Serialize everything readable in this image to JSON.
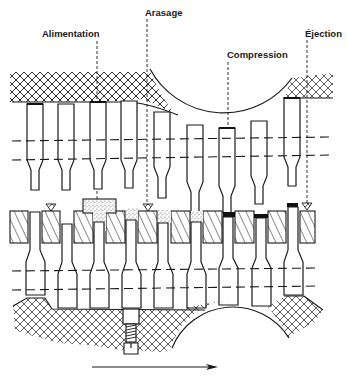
{
  "figure": {
    "type": "rotary tablet press compression cycle schematic",
    "labels": [
      {
        "id": "alimentation",
        "text": "Alimentation",
        "x": 42,
        "y": 37,
        "leader_x": 97
      },
      {
        "id": "arasage",
        "text": "Arasage",
        "x": 145,
        "y": 16,
        "leader_x": 147
      },
      {
        "id": "compression",
        "text": "Compression",
        "x": 227,
        "y": 58,
        "leader_x": 228
      },
      {
        "id": "ejection",
        "text": "Éjection",
        "x": 305,
        "y": 37,
        "leader_x": 307
      }
    ],
    "direction_arrow": {
      "label": "rotation direction",
      "from_x": 92,
      "to_x": 218,
      "y": 367
    },
    "colors": {
      "line": "#1a1a1a",
      "background": "#ffffff",
      "powder": "#bdbdbd",
      "tablet": "#111111"
    },
    "stations": 11
  }
}
